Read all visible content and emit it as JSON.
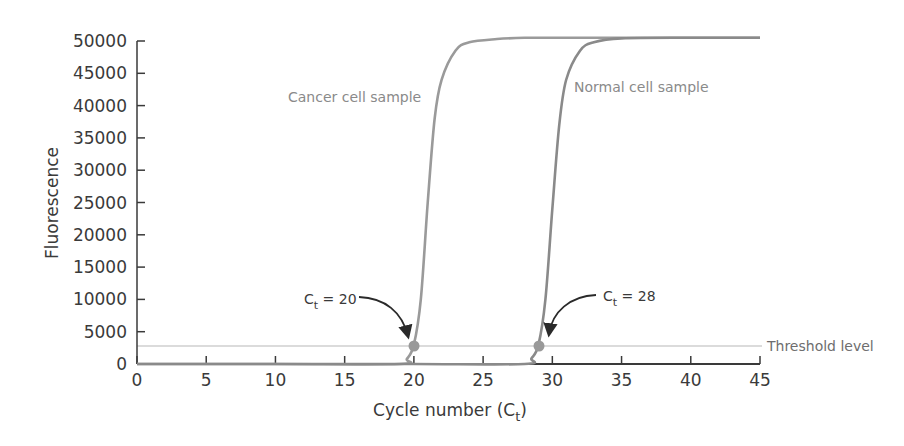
{
  "chart_data": {
    "type": "line",
    "title": "",
    "xlabel": "Cycle number (C_t)",
    "xlabel_main": "Cycle number (C",
    "xlabel_sub": "t",
    "xlabel_end": ")",
    "ylabel": "Fluorescence",
    "xlim": [
      0,
      45
    ],
    "ylim": [
      0,
      50000
    ],
    "x_ticks": [
      0,
      5,
      10,
      15,
      20,
      25,
      30,
      35,
      40,
      45
    ],
    "y_ticks": [
      0,
      5000,
      10000,
      15000,
      20000,
      25000,
      30000,
      35000,
      40000,
      45000,
      50000
    ],
    "grid": false,
    "threshold": {
      "label": "Threshold level",
      "value": 3000
    },
    "series": [
      {
        "name": "Cancer cell sample",
        "color": "#9a9a9a",
        "x": [
          0,
          10,
          19,
          19.5,
          20,
          20.5,
          21,
          21.5,
          22,
          23,
          24,
          26,
          28,
          30,
          35,
          45
        ],
        "y": [
          0,
          0,
          0,
          800,
          3000,
          10000,
          25000,
          38000,
          44000,
          48500,
          49800,
          50300,
          50500,
          50500,
          50500,
          50500
        ]
      },
      {
        "name": "Normal cell sample",
        "color": "#8a8a8a",
        "x": [
          0,
          10,
          20,
          28,
          28.5,
          29,
          29.5,
          30,
          30.5,
          31,
          32,
          33,
          35,
          40,
          45
        ],
        "y": [
          0,
          0,
          0,
          0,
          900,
          3000,
          10000,
          24000,
          37000,
          44000,
          48500,
          49800,
          50400,
          50500,
          50500
        ]
      }
    ],
    "annotations": [
      {
        "text": "C_t = 20",
        "main": "C",
        "sub": "t",
        "rest": " = 20",
        "x": 20,
        "y": 3000
      },
      {
        "text": "C_t = 28",
        "main": "C",
        "sub": "t",
        "rest": " = 28",
        "x": 29,
        "y": 3000,
        "note": "marker plotted at cycle ~29; label as shown"
      }
    ],
    "legend": "none (inline curve labels)"
  }
}
